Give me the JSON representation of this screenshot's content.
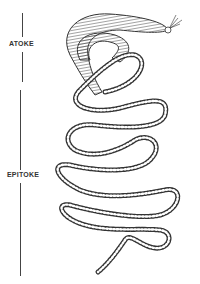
{
  "figure": {
    "labels": {
      "atoke": "ATOKE",
      "epitoke": "EPITOKE"
    },
    "colors": {
      "line": "#333333",
      "background": "#ffffff"
    }
  }
}
